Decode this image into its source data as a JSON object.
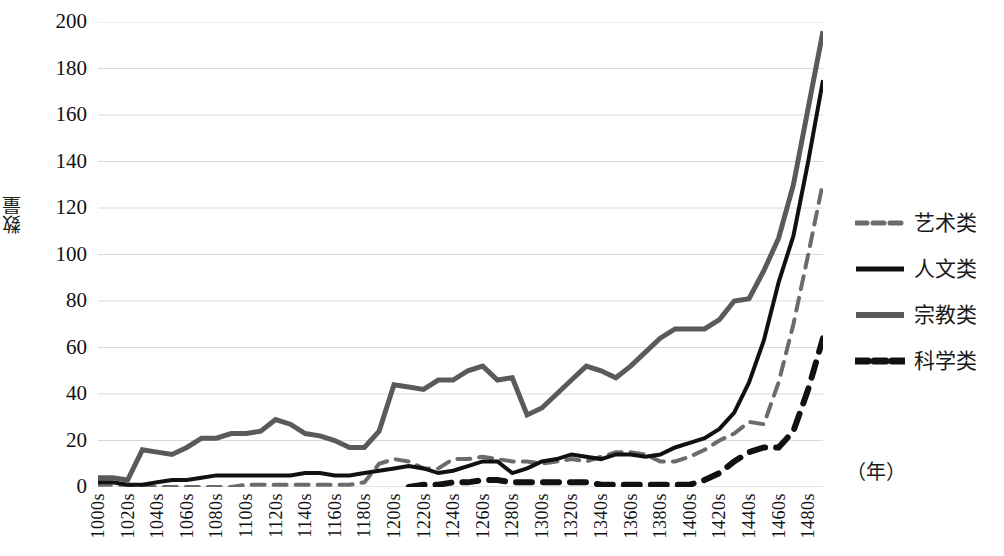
{
  "chart_data": {
    "type": "line",
    "title": "",
    "xlabel": "（年）",
    "ylabel": "数量",
    "ylim": [
      0,
      200
    ],
    "ytick_step": 20,
    "yticks": [
      "200",
      "180",
      "160",
      "140",
      "120",
      "100",
      "80",
      "60",
      "40",
      "20",
      "0"
    ],
    "grid": true,
    "legend_position": "right",
    "x": [
      1000,
      1010,
      1020,
      1030,
      1040,
      1050,
      1060,
      1070,
      1080,
      1090,
      1100,
      1110,
      1120,
      1130,
      1140,
      1150,
      1160,
      1170,
      1180,
      1190,
      1200,
      1210,
      1220,
      1230,
      1240,
      1250,
      1260,
      1270,
      1280,
      1290,
      1300,
      1310,
      1320,
      1330,
      1340,
      1350,
      1360,
      1370,
      1380,
      1390,
      1400,
      1410,
      1420,
      1430,
      1440,
      1450,
      1460,
      1470,
      1480,
      1490
    ],
    "xtick_labels": [
      "1000s",
      "1020s",
      "1040s",
      "1060s",
      "1080s",
      "1100s",
      "1120s",
      "1140s",
      "1160s",
      "1180s",
      "1200s",
      "1220s",
      "1240s",
      "1260s",
      "1280s",
      "1300s",
      "1320s",
      "1340s",
      "1360s",
      "1380s",
      "1400s",
      "1420s",
      "1440s",
      "1460s",
      "1480s"
    ],
    "xtick_values": [
      1000,
      1020,
      1040,
      1060,
      1080,
      1100,
      1120,
      1140,
      1160,
      1180,
      1200,
      1220,
      1240,
      1260,
      1280,
      1300,
      1320,
      1340,
      1360,
      1380,
      1400,
      1420,
      1440,
      1460,
      1480
    ],
    "series": [
      {
        "name": "艺术类",
        "color": "#6b6b6b",
        "style": "dashed",
        "width": 4,
        "values": [
          1,
          1,
          1,
          0,
          0,
          0,
          0,
          0,
          0,
          0,
          1,
          1,
          1,
          1,
          1,
          1,
          1,
          1,
          2,
          10,
          12,
          11,
          8,
          8,
          12,
          12,
          13,
          12,
          11,
          11,
          10,
          11,
          12,
          11,
          13,
          15,
          15,
          14,
          11,
          11,
          13,
          16,
          20,
          23,
          28,
          27,
          45,
          70,
          100,
          131
        ]
      },
      {
        "name": "人文类",
        "color": "#111111",
        "style": "solid",
        "width": 4,
        "values": [
          2,
          2,
          1,
          1,
          2,
          3,
          3,
          4,
          5,
          5,
          5,
          5,
          5,
          5,
          6,
          6,
          5,
          5,
          6,
          7,
          8,
          9,
          8,
          6,
          7,
          9,
          11,
          11,
          6,
          8,
          11,
          12,
          14,
          13,
          12,
          14,
          14,
          13,
          14,
          17,
          19,
          21,
          25,
          32,
          45,
          63,
          88,
          108,
          140,
          175
        ]
      },
      {
        "name": "宗教类",
        "color": "#5a5a5a",
        "style": "solid",
        "width": 5,
        "values": [
          4,
          4,
          3,
          16,
          15,
          14,
          17,
          21,
          21,
          23,
          23,
          24,
          29,
          27,
          23,
          22,
          20,
          17,
          17,
          24,
          44,
          43,
          42,
          46,
          46,
          50,
          52,
          46,
          47,
          31,
          34,
          40,
          46,
          52,
          50,
          47,
          52,
          58,
          64,
          68,
          68,
          68,
          72,
          80,
          81,
          93,
          107,
          130,
          163,
          196
        ]
      },
      {
        "name": "科学类",
        "color": "#111111",
        "style": "dashed",
        "width": 6,
        "values": [
          null,
          null,
          null,
          null,
          null,
          null,
          null,
          null,
          null,
          null,
          null,
          null,
          null,
          null,
          null,
          null,
          null,
          null,
          null,
          null,
          null,
          0,
          1,
          1,
          2,
          2,
          3,
          3,
          2,
          2,
          2,
          2,
          2,
          2,
          1,
          1,
          1,
          1,
          1,
          1,
          1,
          3,
          6,
          11,
          15,
          17,
          17,
          24,
          42,
          64
        ]
      }
    ]
  },
  "legend": {
    "items": [
      {
        "label": "艺术类"
      },
      {
        "label": "人文类"
      },
      {
        "label": "宗教类"
      },
      {
        "label": "科学类"
      }
    ]
  },
  "axes": {
    "y_title": "数量",
    "x_note": "（年）"
  }
}
